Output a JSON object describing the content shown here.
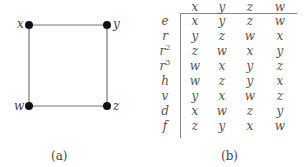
{
  "figure_a": {
    "caption": "(a)",
    "nodes": [
      {
        "id": "x",
        "label": "x",
        "cx": 29,
        "cy": 25,
        "label_side": "left"
      },
      {
        "id": "y",
        "label": "y",
        "cx": 107,
        "cy": 25,
        "label_side": "right"
      },
      {
        "id": "z",
        "label": "z",
        "cx": 107,
        "cy": 106,
        "label_side": "right"
      },
      {
        "id": "w",
        "label": "w",
        "cx": 29,
        "cy": 106,
        "label_side": "left"
      }
    ],
    "edges": [
      [
        "x",
        "y"
      ],
      [
        "y",
        "z"
      ],
      [
        "z",
        "w"
      ],
      [
        "w",
        "x"
      ]
    ]
  },
  "figure_b": {
    "caption": "(b)",
    "columns": [
      "x",
      "y",
      "z",
      "w"
    ],
    "rows": [
      {
        "label": "e",
        "sup": "",
        "values": [
          "x",
          "y",
          "z",
          "w"
        ]
      },
      {
        "label": "r",
        "sup": "",
        "values": [
          "y",
          "z",
          "w",
          "x"
        ]
      },
      {
        "label": "r",
        "sup": "2",
        "values": [
          "z",
          "w",
          "x",
          "y"
        ]
      },
      {
        "label": "r",
        "sup": "3",
        "values": [
          "w",
          "x",
          "y",
          "z"
        ]
      },
      {
        "label": "h",
        "sup": "",
        "values": [
          "w",
          "z",
          "y",
          "x"
        ]
      },
      {
        "label": "v",
        "sup": "",
        "values": [
          "y",
          "x",
          "w",
          "z"
        ]
      },
      {
        "label": "d",
        "sup": "",
        "values": [
          "x",
          "w",
          "z",
          "y"
        ]
      },
      {
        "label": "f",
        "sup": "",
        "values": [
          "z",
          "y",
          "x",
          "w"
        ]
      }
    ]
  }
}
